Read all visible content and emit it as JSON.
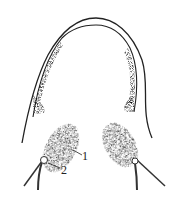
{
  "figure": {
    "labels": [
      {
        "id": "1",
        "text": "1"
      },
      {
        "id": "2",
        "text": "2"
      }
    ],
    "colors": {
      "ink": "#222222",
      "stipple": "#555555",
      "background": "#ffffff"
    }
  }
}
